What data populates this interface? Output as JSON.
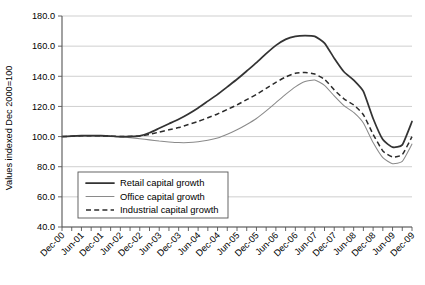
{
  "chart_data": {
    "type": "line",
    "title": "",
    "xlabel": "",
    "ylabel": "Values indexed Dec 2000=100",
    "ylim": [
      40.0,
      180.0
    ],
    "yticks": [
      "40.0",
      "60.0",
      "80.0",
      "100.0",
      "120.0",
      "140.0",
      "160.0",
      "180.0"
    ],
    "ytick_values": [
      40.0,
      60.0,
      80.0,
      100.0,
      120.0,
      140.0,
      160.0,
      180.0
    ],
    "grid": "horizontal",
    "legend_position": "inner-lower-left",
    "categories": [
      "Dec-00",
      "Mar-01",
      "Jun-01",
      "Sep-01",
      "Dec-01",
      "Mar-02",
      "Jun-02",
      "Sep-02",
      "Dec-02",
      "Mar-03",
      "Jun-03",
      "Sep-03",
      "Dec-03",
      "Mar-04",
      "Jun-04",
      "Sep-04",
      "Dec-04",
      "Mar-05",
      "Jun-05",
      "Sep-05",
      "Dec-05",
      "Mar-06",
      "Jun-06",
      "Sep-06",
      "Dec-06",
      "Mar-07",
      "Jun-07",
      "Sep-07",
      "Dec-07",
      "Mar-08",
      "Jun-08",
      "Sep-08",
      "Dec-08",
      "Mar-09",
      "Jun-09",
      "Sep-09",
      "Dec-09"
    ],
    "xtick_labels": [
      "Dec-00",
      "Jun-01",
      "Dec-01",
      "Jun-02",
      "Dec-02",
      "Jun-03",
      "Dec-03",
      "Jun-04",
      "Dec-04",
      "Jun-05",
      "Dec-05",
      "Jun-06",
      "Dec-06",
      "Jun-07",
      "Dec-07",
      "Jun-08",
      "Dec-08",
      "Jun-09",
      "Dec-09"
    ],
    "series": [
      {
        "name": "Retail capital growth",
        "style": "solid-thick",
        "color": "#333333",
        "values": [
          100.0,
          100.3,
          100.6,
          100.7,
          100.6,
          100.3,
          100.0,
          100.1,
          100.5,
          102.5,
          105.5,
          108.5,
          111.5,
          115.0,
          119.0,
          123.5,
          128.0,
          133.0,
          138.0,
          143.5,
          149.0,
          155.0,
          160.5,
          164.5,
          166.5,
          167.0,
          166.5,
          162.0,
          152.0,
          143.0,
          137.5,
          130.0,
          112.0,
          98.0,
          93.0,
          94.5,
          110.0
        ]
      },
      {
        "name": "Office capital growth",
        "style": "solid-thin",
        "color": "#8a8a8a",
        "values": [
          100.0,
          100.2,
          100.4,
          100.4,
          100.3,
          100.1,
          99.8,
          99.3,
          98.6,
          97.8,
          97.0,
          96.4,
          96.0,
          96.0,
          96.5,
          97.5,
          99.0,
          101.5,
          104.5,
          108.0,
          112.0,
          117.0,
          122.5,
          128.0,
          133.0,
          136.5,
          137.5,
          134.0,
          127.0,
          120.5,
          116.0,
          109.0,
          96.0,
          86.0,
          82.0,
          83.5,
          95.0
        ]
      },
      {
        "name": "Industrial capital growth",
        "style": "dashed",
        "color": "#2b2b2b",
        "values": [
          100.0,
          100.2,
          100.5,
          100.6,
          100.5,
          100.3,
          100.0,
          100.1,
          100.4,
          101.5,
          103.0,
          104.5,
          106.0,
          108.0,
          110.0,
          112.5,
          115.0,
          118.0,
          121.0,
          124.5,
          128.0,
          132.0,
          136.0,
          139.5,
          142.0,
          142.5,
          141.5,
          138.0,
          131.0,
          125.0,
          121.0,
          114.5,
          101.5,
          90.5,
          86.5,
          88.0,
          100.0
        ]
      }
    ]
  },
  "legend": {
    "items": [
      {
        "label": "Retail capital growth",
        "style": "solid-thick"
      },
      {
        "label": "Office capital growth",
        "style": "solid-thin"
      },
      {
        "label": "Industrial capital growth",
        "style": "dashed"
      }
    ]
  }
}
